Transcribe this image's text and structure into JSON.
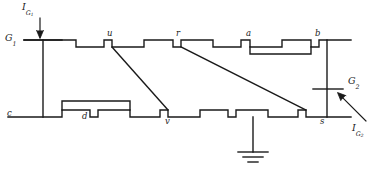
{
  "figure": {
    "type": "circuit-schematic",
    "background_color": "#ffffff",
    "line_color": "#1a1a1a"
  },
  "terminals": [
    {
      "id": "G1",
      "base": "G",
      "sub": "1",
      "x": 8,
      "y": 38,
      "align": "right"
    },
    {
      "id": "G2",
      "base": "G",
      "sub": "2",
      "x": 352,
      "y": 81,
      "align": "left"
    }
  ],
  "currents": [
    {
      "id": "IG1",
      "base": "I",
      "sub": "G1",
      "sub_base": "G",
      "sub_sub": "1",
      "x": 22,
      "y": 3,
      "label": "I"
    },
    {
      "id": "IG2",
      "base": "I",
      "sub": "G2",
      "sub_base": "G",
      "sub_sub": "2",
      "x": 352,
      "y": 118,
      "label": "I"
    }
  ],
  "nodes": [
    {
      "id": "u",
      "label": "u",
      "x": 107,
      "y": 30,
      "rail": "top"
    },
    {
      "id": "r",
      "label": "r",
      "x": 176,
      "y": 30,
      "rail": "top"
    },
    {
      "id": "a",
      "label": "a",
      "x": 246,
      "y": 30,
      "rail": "top"
    },
    {
      "id": "b",
      "label": "b",
      "x": 315,
      "y": 30,
      "rail": "top"
    },
    {
      "id": "c",
      "label": "c",
      "x": 8,
      "y": 110,
      "rail": "bottom"
    },
    {
      "id": "d",
      "label": "d",
      "x": 82,
      "y": 112,
      "rail": "bottom"
    },
    {
      "id": "v",
      "label": "v",
      "x": 166,
      "y": 112,
      "rail": "bottom"
    },
    {
      "id": "s",
      "label": "s",
      "x": 320,
      "y": 112,
      "rail": "bottom"
    }
  ],
  "ground": {
    "x": 253,
    "y": 160,
    "label": ""
  },
  "connections": [
    {
      "from": "u",
      "to": "v",
      "kind": "diagonal"
    },
    {
      "from": "r",
      "to": "s",
      "kind": "diagonal"
    },
    {
      "from": "G1",
      "to": "c",
      "kind": "vertical"
    },
    {
      "from": "b",
      "to": "s",
      "kind": "vertical"
    }
  ]
}
